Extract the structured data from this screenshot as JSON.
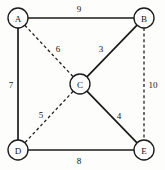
{
  "figure": {
    "background_color": "#fdfdfc",
    "stroke_color": "#1a1a1a",
    "text_color": "#111111"
  },
  "chart_data": {
    "type": "diagram",
    "diagram_kind": "weighted-undirected-graph",
    "title": "",
    "nodes": [
      {
        "id": "A",
        "label": "A",
        "x": 18,
        "y": 18,
        "r": 10
      },
      {
        "id": "B",
        "label": "B",
        "x": 144,
        "y": 18,
        "r": 10
      },
      {
        "id": "C",
        "label": "C",
        "x": 80,
        "y": 84,
        "r": 10
      },
      {
        "id": "D",
        "label": "D",
        "x": 18,
        "y": 150,
        "r": 10
      },
      {
        "id": "E",
        "label": "E",
        "x": 144,
        "y": 150,
        "r": 10
      }
    ],
    "edges": [
      {
        "from": "A",
        "to": "B",
        "weight": 9,
        "style": "solid",
        "label_x": 79,
        "label_y": 9
      },
      {
        "from": "A",
        "to": "D",
        "weight": 7,
        "style": "solid",
        "label_x": 11,
        "label_y": 85
      },
      {
        "from": "A",
        "to": "C",
        "weight": 6,
        "style": "dashed",
        "label_x": 58,
        "label_y": 49
      },
      {
        "from": "B",
        "to": "C",
        "weight": 3,
        "style": "solid",
        "label_x": 101,
        "label_y": 49
      },
      {
        "from": "B",
        "to": "E",
        "weight": 10,
        "style": "dashed",
        "label_x": 153,
        "label_y": 85
      },
      {
        "from": "C",
        "to": "D",
        "weight": 5,
        "style": "dashed",
        "label_x": 41,
        "label_y": 115
      },
      {
        "from": "C",
        "to": "E",
        "weight": 4,
        "style": "solid",
        "label_x": 119,
        "label_y": 116
      },
      {
        "from": "D",
        "to": "E",
        "weight": 8,
        "style": "solid",
        "label_x": 79,
        "label_y": 161
      }
    ],
    "node_count": 5,
    "edge_count": 8,
    "legend": []
  }
}
